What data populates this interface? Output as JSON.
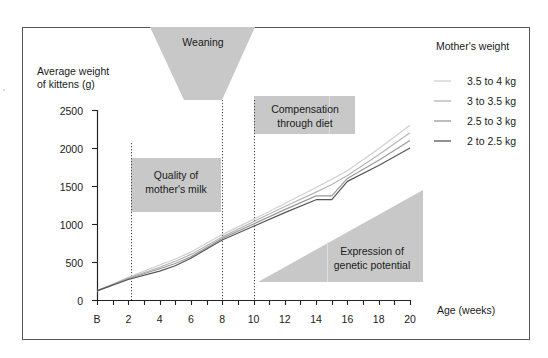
{
  "chart_data": {
    "type": "line",
    "ylabel_line1": "Average weight",
    "ylabel_line2": "of kittens (g)",
    "xlabel": "Age (weeks)",
    "legend_title": "Mother's weight",
    "ylim": [
      0,
      2500
    ],
    "xlim": [
      0,
      20
    ],
    "yticks": [
      0,
      500,
      1000,
      1500,
      2000,
      2500
    ],
    "xtick_labels": [
      "B",
      "2",
      "4",
      "6",
      "8",
      "10",
      "12",
      "14",
      "16",
      "18",
      "20"
    ],
    "x": [
      0,
      2,
      4,
      5,
      6,
      8,
      10,
      12,
      14,
      15,
      16,
      18,
      20
    ],
    "series": [
      {
        "name": "3.5 to 4 kg",
        "color": "#cfcfcf",
        "values": [
          120,
          300,
          460,
          540,
          630,
          860,
          1060,
          1270,
          1480,
          1590,
          1700,
          1990,
          2300
        ]
      },
      {
        "name": "3 to 3.5 kg",
        "color": "#b5b5b5",
        "values": [
          120,
          290,
          430,
          510,
          600,
          830,
          1030,
          1230,
          1420,
          1520,
          1640,
          1910,
          2200
        ]
      },
      {
        "name": "2.5 to 3 kg",
        "color": "#9a9a9a",
        "values": [
          120,
          280,
          410,
          480,
          570,
          810,
          1000,
          1190,
          1370,
          1370,
          1600,
          1840,
          2100
        ]
      },
      {
        "name": "2 to 2.5 kg",
        "color": "#555555",
        "values": [
          120,
          270,
          380,
          450,
          550,
          790,
          970,
          1150,
          1320,
          1320,
          1560,
          1770,
          2000
        ]
      }
    ],
    "annotations": [
      {
        "name": "weaning",
        "text": "Weaning"
      },
      {
        "name": "quality",
        "line1": "Quality of",
        "line2": "mother's milk"
      },
      {
        "name": "compensation",
        "line1": "Compensation",
        "line2": "through diet"
      },
      {
        "name": "genetic",
        "line1": "Expression of",
        "line2": "genetic potential"
      }
    ],
    "vertical_markers": [
      2.2,
      8,
      10
    ],
    "grid": false,
    "legend_position": "top-right"
  }
}
